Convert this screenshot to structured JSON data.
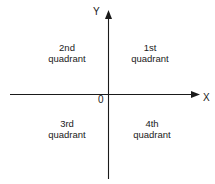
{
  "figure": {
    "type": "cartesian-quadrant-diagram",
    "width": 215,
    "height": 184,
    "background_color": "#ffffff",
    "line_color": "#1a1a1a",
    "text_color": "#1a1a1a"
  },
  "axes": {
    "x_axis": {
      "label": "X",
      "orientation": "horizontal",
      "arrow_end": "right",
      "y_position": 94,
      "start_x": 10,
      "end_x": 200
    },
    "y_axis": {
      "label": "Y",
      "orientation": "vertical",
      "arrow_end": "top",
      "x_position": 108,
      "start_y": 10,
      "end_y": 179
    },
    "origin": {
      "label": "0",
      "x": 108,
      "y": 94
    }
  },
  "quadrants": [
    {
      "id": "quadrant-1",
      "ordinal": "1st",
      "word": "quadrant",
      "position": "top-right"
    },
    {
      "id": "quadrant-2",
      "ordinal": "2nd",
      "word": "quadrant",
      "position": "top-left"
    },
    {
      "id": "quadrant-3",
      "ordinal": "3rd",
      "word": "quadrant",
      "position": "bottom-left"
    },
    {
      "id": "quadrant-4",
      "ordinal": "4th",
      "word": "quadrant",
      "position": "bottom-right"
    }
  ]
}
